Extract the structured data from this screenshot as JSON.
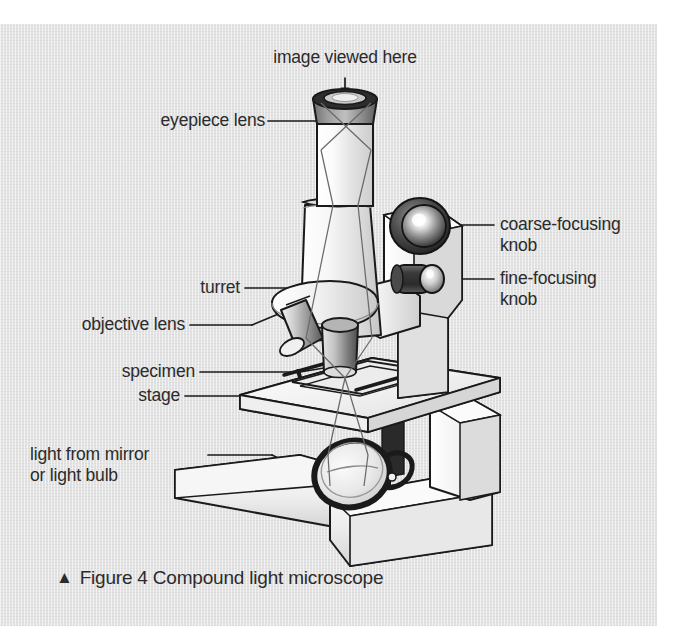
{
  "figure": {
    "caption_marker": "▲",
    "caption_text": "Figure 4 Compound light microscope",
    "background_color": "#e3e3e3",
    "text_color": "#2b2b2b",
    "line_color": "#1a1a1a"
  },
  "labels": {
    "image_viewed_here": "image viewed here",
    "eyepiece_lens": "eyepiece lens",
    "coarse_focusing_knob": "coarse-focusing\nknob",
    "fine_focusing_knob": "fine-focusing\nknob",
    "turret": "turret",
    "objective_lens": "objective lens",
    "specimen": "specimen",
    "stage": "stage",
    "light_source": "light from mirror\nor light bulb"
  },
  "diagram": {
    "subject": "compound light microscope",
    "parts": [
      "eyepiece lens",
      "body tube",
      "coarse-focusing knob",
      "fine-focusing knob",
      "turret",
      "objective lens",
      "specimen",
      "stage",
      "mirror or light bulb",
      "arm",
      "base"
    ]
  }
}
